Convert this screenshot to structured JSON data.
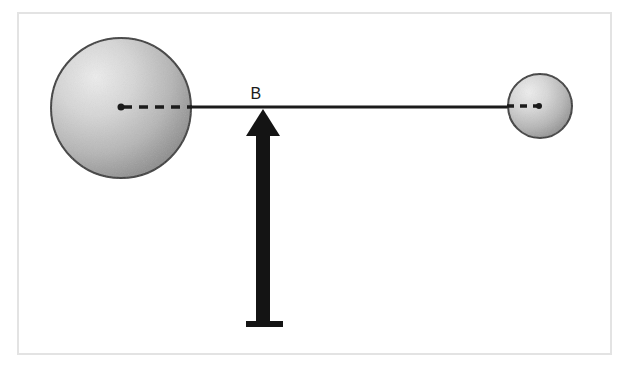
{
  "figure": {
    "canvas": {
      "width": 632,
      "height": 374,
      "background": "#ffffff"
    },
    "frame": {
      "name": "figure-border",
      "x": 17,
      "y": 12,
      "width": 595,
      "height": 343,
      "color": "#e3e3e3",
      "stroke_width": 2
    },
    "spheres": [
      {
        "id": "large-sphere",
        "label": "",
        "cx": 121,
        "cy": 108,
        "r": 71,
        "fill_light": "#e8e8e8",
        "fill_dark": "#8e8e8e",
        "stroke": "#3a3a3a",
        "stroke_width": 2,
        "highlight_x": 78,
        "highlight_y": 62
      },
      {
        "id": "small-sphere",
        "label": "",
        "cx": 540,
        "cy": 106,
        "r": 33,
        "fill_light": "#e8e8e8",
        "fill_dark": "#8e8e8e",
        "stroke": "#3a3a3a",
        "stroke_width": 2,
        "highlight_x": 522,
        "highlight_y": 86
      }
    ],
    "connecting_rod": {
      "id": "rod",
      "x1": 186,
      "y1": 107,
      "x2": 512,
      "y2": 107,
      "color": "#1b1b1b",
      "stroke_width": 3
    },
    "radius_dashes": [
      {
        "id": "large-sphere-radius",
        "x1": 121,
        "y1": 107,
        "x2": 192,
        "y2": 107,
        "color": "#1b1b1b",
        "stroke_width": 3,
        "dash": "9 7",
        "center_dot_r": 3.5
      },
      {
        "id": "small-sphere-radius",
        "x1": 539,
        "y1": 106,
        "x2": 507,
        "y2": 106,
        "color": "#1b1b1b",
        "stroke_width": 3,
        "dash": "7 6",
        "center_dot_r": 3
      }
    ],
    "support_arrow": {
      "id": "pivot-arrow",
      "color": "#141414",
      "tip_x": 263,
      "tip_y": 109,
      "head_half_width": 17,
      "head_bottom_y": 136,
      "shaft_left": 256,
      "shaft_right": 270,
      "shaft_bottom_y": 322,
      "base_left": 246,
      "base_right": 283,
      "base_top_y": 321,
      "base_bottom_y": 327
    },
    "labels": [
      {
        "id": "label-B",
        "text": "B",
        "x": 256,
        "y": 99,
        "font_size": 16,
        "color": "#1b1b1b"
      }
    ]
  }
}
